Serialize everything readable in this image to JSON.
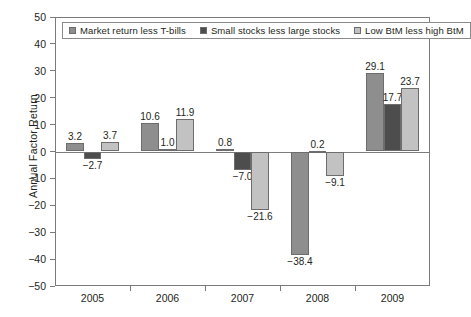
{
  "chart_data": {
    "type": "bar",
    "title": "",
    "subtitle": "",
    "xlabel": "",
    "ylabel": "Annual Factor Return",
    "categories": [
      "2005",
      "2006",
      "2007",
      "2008",
      "2009"
    ],
    "ylim": [
      -50,
      50
    ],
    "yticks": [
      50,
      40,
      30,
      20,
      10,
      0,
      -10,
      -20,
      -30,
      -40,
      -50
    ],
    "ytick_labels": [
      "50",
      "40",
      "30",
      "20",
      "10",
      "0",
      "−10",
      "−20",
      "−30",
      "−40",
      "−50"
    ],
    "grid": false,
    "legend_position": "top-left-inside",
    "series": [
      {
        "name": "Market return less T-bills",
        "color": "#8e8e8e",
        "values": [
          3.2,
          10.6,
          0.8,
          -38.4,
          29.1
        ],
        "labels": [
          "3.2",
          "10.6",
          "0.8",
          "−38.4",
          "29.1"
        ]
      },
      {
        "name": "Small stocks less large stocks",
        "color": "#4d4d4d",
        "values": [
          -2.7,
          1.0,
          -7.0,
          0.2,
          17.7
        ],
        "labels": [
          "−2.7",
          "1.0",
          "−7.0",
          "0.2",
          "17.7"
        ]
      },
      {
        "name": "Low BtM less high BtM",
        "color": "#c2c2c2",
        "values": [
          3.7,
          11.9,
          -21.6,
          -9.1,
          23.7
        ],
        "labels": [
          "3.7",
          "11.9",
          "−21.6",
          "−9.1",
          "23.7"
        ]
      }
    ]
  },
  "colors": {
    "axis": "#7b7b7b",
    "text": "#231f20",
    "background": "#ffffff",
    "series_1": "#8e8e8e",
    "series_2": "#4d4d4d",
    "series_3": "#c2c2c2"
  }
}
